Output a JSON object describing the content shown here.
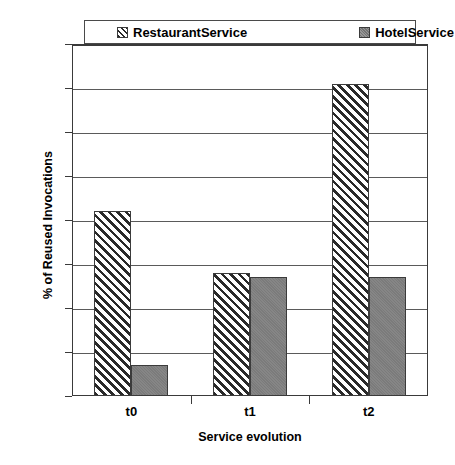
{
  "chart_data": {
    "type": "bar",
    "title": "",
    "xlabel": "Service evolution",
    "ylabel": "% of Reused Invocations",
    "categories": [
      "t0",
      "t1",
      "t2"
    ],
    "series": [
      {
        "name": "RestaurantService",
        "values": [
          42,
          28,
          71
        ],
        "pattern": "diagonal-hatch",
        "color": "#ffffff"
      },
      {
        "name": "HotelService",
        "values": [
          7,
          27,
          27
        ],
        "pattern": "solid",
        "color": "#808080"
      }
    ],
    "ylim": [
      0,
      80
    ],
    "yticks": [
      0,
      10,
      20,
      30,
      40,
      50,
      60,
      70,
      80
    ],
    "ytick_labels": [
      "0",
      "10",
      "20",
      "30",
      "40",
      "50",
      "60",
      "70",
      "80"
    ],
    "grid": true,
    "legend_position": "top-inside",
    "legend": [
      "RestaurantService",
      "HotelService"
    ]
  },
  "axes": {
    "y_title": "% of Reused Invocations",
    "x_title": "Service evolution"
  },
  "legend": {
    "entries": [
      {
        "label": "RestaurantService",
        "swatch": "hatched-square-icon"
      },
      {
        "label": "HotelService",
        "swatch": "gray-square-icon"
      }
    ]
  }
}
